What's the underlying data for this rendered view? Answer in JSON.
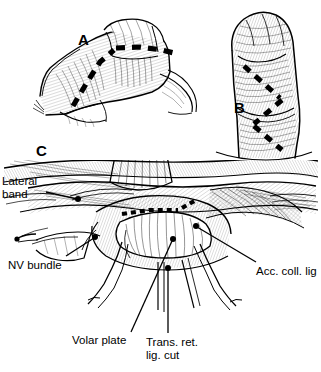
{
  "figure": {
    "kind": "medical-line-illustration",
    "style": "pen-and-ink hatched surgical drawing",
    "background_color": "#ffffff",
    "ink_color": "#000000",
    "width": 321,
    "height": 372,
    "panels": [
      {
        "letter": "A",
        "description": "Flexed finger, dorsolateral view, with heavy dashed midlateral incision line running from proximal phalanx to distal interphalangeal level",
        "letter_x": 78,
        "letter_y": 32
      },
      {
        "letter": "B",
        "description": "Finger in lateral view with heavy dashed zigzag (Bruner-type) incision line",
        "letter_x": 234,
        "letter_y": 100
      },
      {
        "letter": "C",
        "description": "Operative exposure of the proximal interphalangeal joint, volar approach, flexor tendon retracted on hooks",
        "letter_x": 36,
        "letter_y": 143
      }
    ]
  },
  "annotations": [
    {
      "id": "lateral-band",
      "lines": [
        "Lateral",
        "band"
      ],
      "label_x": 2,
      "label_y": 175,
      "leader": {
        "x1": 46,
        "y1": 192,
        "x2": 77,
        "y2": 199
      },
      "dot": {
        "cx": 78,
        "cy": 199,
        "r": 3
      }
    },
    {
      "id": "nv-bundle",
      "lines": [
        "NV bundle"
      ],
      "label_x": 8,
      "label_y": 259,
      "leader": {
        "x1": 66,
        "y1": 256,
        "x2": 94,
        "y2": 238
      },
      "dot": {
        "cx": 95,
        "cy": 237,
        "r": 3
      }
    },
    {
      "id": "acc-coll-lig",
      "lines": [
        "Acc. coll. lig"
      ],
      "label_x": 256,
      "label_y": 265,
      "leader": {
        "x1": 256,
        "y1": 262,
        "x2": 197,
        "y2": 227
      },
      "dot": {
        "cx": 196,
        "cy": 226,
        "r": 3
      }
    },
    {
      "id": "volar-plate",
      "lines": [
        "Volar plate"
      ],
      "label_x": 72,
      "label_y": 334,
      "leader": {
        "x1": 131,
        "y1": 332,
        "x2": 172,
        "y2": 241
      },
      "dot": {
        "cx": 173,
        "cy": 239,
        "r": 3
      }
    },
    {
      "id": "trans-ret-lig-cut",
      "lines": [
        "Trans. ret.",
        "lig. cut"
      ],
      "label_x": 146,
      "label_y": 336,
      "leader": {
        "x1": 168,
        "y1": 333,
        "x2": 168,
        "y2": 269
      },
      "dot": {
        "cx": 168,
        "cy": 268,
        "r": 3
      }
    }
  ]
}
